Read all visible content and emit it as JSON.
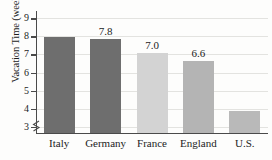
{
  "chart_data": {
    "type": "bar",
    "title": "",
    "xlabel": "",
    "ylabel": "Vacation Time (weeks)",
    "categories": [
      "Italy",
      "Germany",
      "France",
      "England",
      "U.S."
    ],
    "values": [
      7.9,
      7.8,
      7.0,
      6.6,
      3.8
    ],
    "data_labels": [
      "",
      "7.8",
      "7.0",
      "6.6",
      ""
    ],
    "bar_colors": [
      "#6e6e6e",
      "#6e6e6e",
      "#d3d3d3",
      "#b4b4b4",
      "#b9b9b9"
    ],
    "ylim": [
      2.6,
      9.4
    ],
    "yticks": [
      3,
      4,
      5,
      6,
      7,
      8,
      9
    ],
    "ytick_labels": [
      "3",
      "4",
      "5",
      "6",
      "7",
      "8",
      "9"
    ],
    "grid": true,
    "grid_color": "#e3e3e0",
    "axis_color": "#4a4a4a",
    "axis_break": true,
    "legend": "none"
  }
}
